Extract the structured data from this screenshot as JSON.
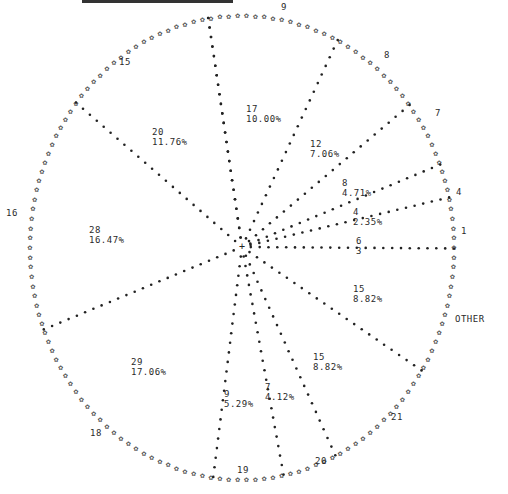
{
  "chart_data": {
    "type": "pie",
    "title": "",
    "style": "line-printer pie chart; sectors outlined with dots, circumference drawn with asterisk-like glyphs",
    "total": 170,
    "slices": [
      {
        "category": "9",
        "count": 17,
        "percent": "10.00%"
      },
      {
        "category": "8",
        "count": 12,
        "percent": "7.06%"
      },
      {
        "category": "7",
        "count": 8,
        "percent": "4.71%"
      },
      {
        "category": "4",
        "count": 4,
        "percent": "2.35%"
      },
      {
        "category": "1",
        "count": 6,
        "percent": "3.53%"
      },
      {
        "category": "OTHER",
        "count": 15,
        "percent": "8.82%"
      },
      {
        "category": "21",
        "count": 15,
        "percent": "8.82%"
      },
      {
        "category": "20",
        "count": 7,
        "percent": "4.12%"
      },
      {
        "category": "19",
        "count": 9,
        "percent": "5.29%"
      },
      {
        "category": "18",
        "count": 29,
        "percent": "17.06%"
      },
      {
        "category": "16",
        "count": 28,
        "percent": "16.47%"
      },
      {
        "category": "15",
        "count": 20,
        "percent": "11.76%"
      }
    ],
    "outer_labels": [
      "9",
      "8",
      "7",
      "4",
      "1",
      "OTHER",
      "21",
      "20",
      "19",
      "18",
      "16",
      "15"
    ],
    "legend": "none",
    "grid": false
  },
  "inner_labels": [
    {
      "count": "17",
      "pct": "10.00%",
      "x": 246,
      "y": 104
    },
    {
      "count": "12",
      "pct": "7.06%",
      "x": 310,
      "y": 139
    },
    {
      "count": "8",
      "pct": "4.71%",
      "x": 342,
      "y": 178
    },
    {
      "count": "4",
      "pct": "2.35%",
      "x": 353,
      "y": 207
    },
    {
      "count": "6",
      "pct": "3",
      "x": 356,
      "y": 236
    },
    {
      "count": "15",
      "pct": "8.82%",
      "x": 353,
      "y": 284
    },
    {
      "count": "15",
      "pct": "8.82%",
      "x": 313,
      "y": 352
    },
    {
      "count": "7",
      "pct": "4.12%",
      "x": 265,
      "y": 382
    },
    {
      "count": "9",
      "pct": "5.29%",
      "x": 224,
      "y": 389
    },
    {
      "count": "29",
      "pct": "17.06%",
      "x": 131,
      "y": 357
    },
    {
      "count": "28",
      "pct": "16.47%",
      "x": 89,
      "y": 225
    },
    {
      "count": "20",
      "pct": "11.76%",
      "x": 152,
      "y": 127
    }
  ],
  "outer_label_positions": [
    {
      "text": "9",
      "x": 281,
      "y": 2
    },
    {
      "text": "15",
      "x": 119,
      "y": 57
    },
    {
      "text": "8",
      "x": 384,
      "y": 50
    },
    {
      "text": "7",
      "x": 435,
      "y": 108
    },
    {
      "text": "4",
      "x": 456,
      "y": 187
    },
    {
      "text": "1",
      "x": 461,
      "y": 226
    },
    {
      "text": "OTHER",
      "x": 455,
      "y": 314
    },
    {
      "text": "21",
      "x": 391,
      "y": 412
    },
    {
      "text": "20",
      "x": 315,
      "y": 456
    },
    {
      "text": "19",
      "x": 237,
      "y": 465
    },
    {
      "text": "18",
      "x": 90,
      "y": 428
    },
    {
      "text": "16",
      "x": 6,
      "y": 208
    }
  ]
}
